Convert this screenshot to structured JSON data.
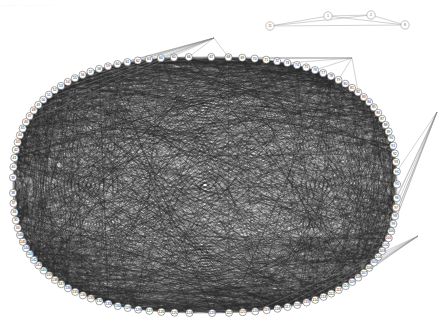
{
  "page": {
    "background_color": "#ffffff",
    "width": 442,
    "height": 322,
    "header_text": "......... .. . .... .  ..     .   .   ."
  },
  "graph": {
    "type": "node-link-diagram",
    "layout": "circular",
    "node_shape": "circle",
    "node_fill": "#ffffff",
    "node_stroke": "#5a5a5a",
    "edge_color": "#303030",
    "edge_opacity": 0.55,
    "description": "Dense circular network with numbered perimeter nodes and a small separate 4-node component",
    "main_component": {
      "name": "main-ring",
      "node_count": 113,
      "center_x": 205,
      "center_y": 185,
      "radius_x": 192,
      "radius_y": 128,
      "node_radius": 3.6,
      "edge_count_estimate": 4200,
      "labels": [
        "34",
        "35",
        "36",
        "37",
        "38",
        "39",
        "40",
        "41",
        "42",
        "43",
        "44",
        "45",
        "46",
        "47",
        "48",
        "49",
        "50",
        "51",
        "52",
        "53",
        "54",
        "55",
        "56",
        "57",
        "58",
        "59",
        "60",
        "61",
        "62",
        "63",
        "64",
        "65",
        "66",
        "67",
        "68",
        "69",
        "70",
        "71",
        "72",
        "73",
        "74",
        "75",
        "76",
        "77",
        "78",
        "79",
        "80",
        "81",
        "82",
        "83",
        "84",
        "85",
        "86",
        "87",
        "88",
        "89",
        "90",
        "91",
        "92",
        "93",
        "94",
        "95",
        "96",
        "97",
        "98",
        "99",
        "100",
        "101",
        "102",
        "103",
        "104",
        "105",
        "106",
        "107",
        "108",
        "109",
        "110",
        "111",
        "112",
        "113",
        "114",
        "115",
        "116",
        "117",
        "118",
        "119",
        "120",
        "121",
        "122",
        "123",
        "124",
        "125",
        "126",
        "127",
        "128",
        "129",
        "130",
        "131",
        "132",
        "133",
        "134",
        "135",
        "136",
        "137",
        "138",
        "139",
        "140",
        "141",
        "142",
        "143",
        "144",
        "145",
        "146"
      ]
    },
    "small_component": {
      "name": "isolated-cluster",
      "node_count": 4,
      "labels": [
        "11",
        "1",
        "2",
        "8"
      ],
      "positions": [
        {
          "label": "11",
          "x": 270,
          "y": 26
        },
        {
          "label": "1",
          "x": 328,
          "y": 16
        },
        {
          "label": "2",
          "x": 371,
          "y": 15
        },
        {
          "label": "8",
          "x": 405,
          "y": 25
        }
      ],
      "edges": [
        {
          "from": "11",
          "to": "1"
        },
        {
          "from": "11",
          "to": "2"
        },
        {
          "from": "11",
          "to": "8"
        },
        {
          "from": "1",
          "to": "2"
        },
        {
          "from": "1",
          "to": "8"
        },
        {
          "from": "2",
          "to": "8"
        }
      ]
    }
  },
  "legend": {
    "visible": false
  }
}
